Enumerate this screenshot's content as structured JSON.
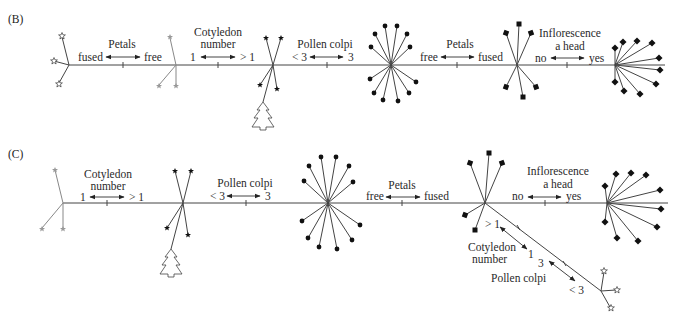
{
  "panels": [
    {
      "id": "B",
      "label": "(B)",
      "characters": [
        {
          "title": [
            "Petals"
          ],
          "left": "fused",
          "right": "free"
        },
        {
          "title": [
            "Cotyledon",
            "number"
          ],
          "left": "1",
          "right": "> 1"
        },
        {
          "title": [
            "Pollen colpi"
          ],
          "left": "< 3",
          "right": "3"
        },
        {
          "title": [
            "Petals"
          ],
          "left": "free",
          "right": "fused"
        },
        {
          "title": [
            "Inflorescence",
            "a head"
          ],
          "left": "no",
          "right": "yes"
        }
      ]
    },
    {
      "id": "C",
      "label": "(C)",
      "characters": [
        {
          "title": [
            "Cotyledon",
            "number"
          ],
          "left": "1",
          "right": "> 1"
        },
        {
          "title": [
            "Pollen colpi"
          ],
          "left": "< 3",
          "right": "3"
        },
        {
          "title": [
            "Petals"
          ],
          "left": "free",
          "right": "fused"
        },
        {
          "title": [
            "Inflorescence",
            "a head"
          ],
          "left": "no",
          "right": "yes"
        }
      ],
      "branch_characters": [
        {
          "title": [
            "Cotyledon",
            "number"
          ],
          "left": "> 1",
          "right": "1"
        },
        {
          "title": [
            "Pollen colpi"
          ],
          "left": "3",
          "right": "< 3"
        }
      ]
    }
  ],
  "icons": [
    "open-star-flower",
    "gray-branch",
    "black-star-with-tree",
    "round-dot-burst",
    "square-dot-spray",
    "diamond-head"
  ]
}
